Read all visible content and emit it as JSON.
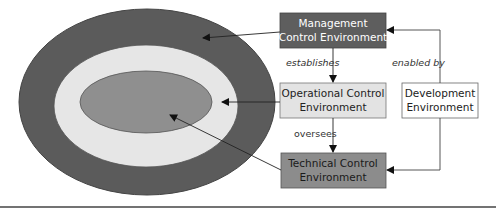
{
  "diagram": {
    "ellipses": [
      {
        "name": "management-layer",
        "color": "#5b5b5b"
      },
      {
        "name": "operational-layer",
        "color": "#e6e6e6"
      },
      {
        "name": "technical-layer",
        "color": "#8f8f8f"
      }
    ],
    "boxes": {
      "management": {
        "line1": "Management",
        "line2": "Control Environment",
        "fill": "#5e5e5e",
        "text_color": "#ffffff"
      },
      "operational": {
        "line1": "Operational Control",
        "line2": "Environment",
        "fill": "#e3e3e3",
        "text_color": "#222222"
      },
      "technical": {
        "line1": "Technical Control",
        "line2": "Environment",
        "fill": "#8c8c8c",
        "text_color": "#1a1a1a"
      },
      "development": {
        "line1": "Development",
        "line2": "Environment",
        "fill": "#ffffff",
        "text_color": "#222222"
      }
    },
    "edge_labels": {
      "establishes": "establishes",
      "oversees": "oversees",
      "enabled_by": "enabled by"
    }
  }
}
